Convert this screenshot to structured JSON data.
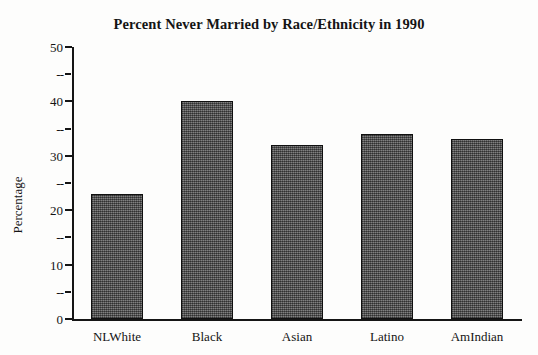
{
  "chart_data": {
    "type": "bar",
    "title": "Percent Never Married by Race/Ethnicity in 1990",
    "xlabel": "",
    "ylabel": "Percentage",
    "categories": [
      "NLWhite",
      "Black",
      "Asian",
      "Latino",
      "AmIndian"
    ],
    "values": [
      23,
      40,
      32,
      34,
      33
    ],
    "ylim": [
      0,
      50
    ],
    "y_major_ticks": [
      0,
      10,
      20,
      30,
      40,
      50
    ],
    "y_minor_ticks": [
      5,
      15,
      25,
      35,
      45
    ],
    "y_tick_labels": [
      "0",
      "10",
      "20",
      "30",
      "40",
      "50"
    ],
    "y_minor_tick_labels": [
      "--",
      "--",
      "--",
      "--",
      "--"
    ],
    "grid": false,
    "legend": null,
    "legend_position": "none",
    "series": [
      {
        "name": "Percent Never Married",
        "values": [
          23,
          40,
          32,
          34,
          33
        ]
      }
    ],
    "bar_fill_color": "#5f5f5f",
    "bar_edge_color": "#101010",
    "background_color": "#fdfdfc",
    "text_color": "#141414"
  }
}
